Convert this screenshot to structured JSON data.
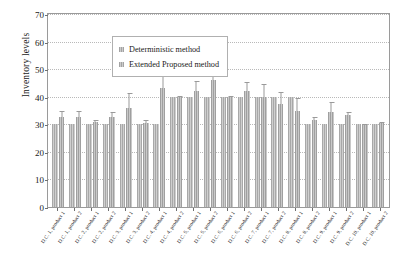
{
  "chart_data": {
    "type": "bar",
    "title": "",
    "xlabel": "",
    "ylabel": "Inventory levels",
    "ylim": [
      0,
      70
    ],
    "ytick_step": 10,
    "yticks": [
      0,
      10,
      20,
      30,
      40,
      50,
      60,
      70
    ],
    "grid": true,
    "legend_position": "top-left inside plot",
    "orientation": "vertical",
    "grouped": true,
    "categories": [
      "D.C. 1, product 1",
      "D.C. 1, product 2",
      "D.C. 2, product 1",
      "D.C. 2, product 2",
      "D.C. 3, product 1",
      "D.C. 3, product 2",
      "D.C. 4, product 1",
      "D.C. 4, product 2",
      "D.C. 5, product 1",
      "D.C. 5, product 2",
      "D.C. 6, product 1",
      "D.C. 6, product 2",
      "D.C. 7, product 1",
      "D.C. 7, product 2",
      "D.C. 8, product 1",
      "D.C. 8, product 2",
      "D.C. 9, product 1",
      "D.C. 9, product 2",
      "D.C. 10, product 1",
      "D.C. 10, product 2"
    ],
    "series": [
      {
        "name": "Deterministic method",
        "color": "#a8a8a8",
        "values": [
          30,
          30,
          30,
          30,
          30,
          30,
          30,
          40,
          40,
          40,
          40,
          40,
          40,
          40,
          40,
          30,
          30,
          30,
          30,
          30
        ],
        "errors": [
          0,
          0,
          0,
          0,
          0,
          0,
          0,
          0,
          0,
          0,
          0,
          0,
          0,
          0,
          0,
          0,
          0,
          0,
          0,
          0
        ]
      },
      {
        "name": "Extended Proposed method",
        "color": "#9f9f9f",
        "values": [
          32.5,
          32.5,
          30.8,
          32.5,
          36,
          30.5,
          43,
          40,
          42,
          46,
          40,
          42,
          40,
          37.5,
          34.8,
          31.5,
          34.5,
          33.5,
          30,
          30.3
        ],
        "errors": [
          2.2,
          2.2,
          0.9,
          2.1,
          5.5,
          1.0,
          5.2,
          0.3,
          3.8,
          10.5,
          0.3,
          3.3,
          4.8,
          4.2,
          4.9,
          1.2,
          3.5,
          1.0,
          0.2,
          0.6
        ]
      }
    ]
  },
  "legend": {
    "items": [
      {
        "label": "Deterministic method"
      },
      {
        "label": "Extended Proposed method"
      }
    ]
  },
  "axes": {
    "y_title": "Inventory levels"
  }
}
